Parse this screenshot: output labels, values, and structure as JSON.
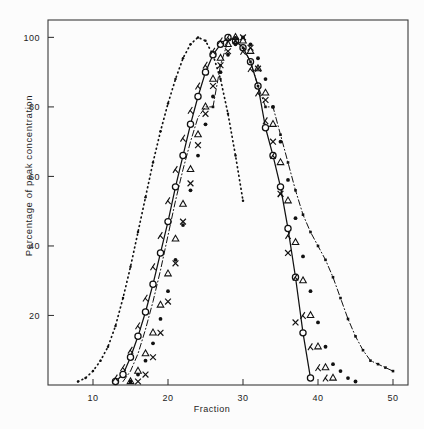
{
  "figure": {
    "background": "#fcfcfc",
    "axis_color": "#3a3a3a",
    "ink_color": "#111111"
  },
  "axes": {
    "xlabel": "Fraction",
    "ylabel": "Percentage of  peak  concentration",
    "x_ticks": [
      "10",
      "20",
      "30",
      "40",
      "50"
    ],
    "y_ticks": [
      "20",
      "40",
      "60",
      "80",
      "100"
    ]
  },
  "chart_data": {
    "type": "line",
    "title": "",
    "xlabel": "Fraction",
    "ylabel": "Percentage of peak concentration",
    "xlim": [
      4,
      52
    ],
    "ylim": [
      0,
      105
    ],
    "x_ticks": [
      10,
      20,
      30,
      40,
      50
    ],
    "y_ticks": [
      20,
      40,
      60,
      80,
      100
    ],
    "grid": false,
    "legend": "none",
    "frame": "box",
    "series": [
      {
        "name": "dotted-leading",
        "marker": "small-dot",
        "line": "dotted",
        "x": [
          8,
          9,
          10,
          11,
          12,
          13,
          14,
          15,
          16,
          17,
          18,
          19,
          20,
          21,
          22,
          23,
          24,
          25,
          26,
          27,
          28,
          29,
          30
        ],
        "y": [
          1,
          2,
          4,
          7,
          11,
          17,
          25,
          34,
          44,
          54,
          64,
          73,
          81,
          88,
          94,
          98,
          100,
          99,
          95,
          88,
          78,
          66,
          53
        ]
      },
      {
        "name": "open-circle-solid",
        "marker": "open-circle",
        "line": "solid",
        "x": [
          13,
          14,
          15,
          16,
          17,
          18,
          19,
          20,
          21,
          22,
          23,
          24,
          25,
          26,
          27,
          28,
          29,
          30,
          31,
          32,
          33,
          34,
          35,
          36,
          37,
          38,
          39
        ],
        "y": [
          1,
          3,
          8,
          14,
          21,
          29,
          38,
          47,
          57,
          66,
          75,
          83,
          90,
          95,
          98,
          100,
          99,
          97,
          93,
          86,
          74,
          66,
          57,
          45,
          31,
          15,
          2
        ]
      },
      {
        "name": "lambda-marker",
        "marker": "lambda",
        "line": "none",
        "x": [
          13,
          14,
          15,
          16,
          17,
          18,
          19,
          20,
          21,
          22,
          23,
          24,
          25,
          26,
          27,
          28,
          29,
          30,
          31,
          32,
          33,
          34,
          35,
          36,
          37,
          38,
          39,
          40,
          41
        ],
        "y": [
          2,
          5,
          10,
          17,
          25,
          34,
          43,
          53,
          62,
          71,
          79,
          86,
          92,
          96,
          99,
          100,
          99,
          96,
          91,
          84,
          76,
          66,
          55,
          43,
          31,
          20,
          11,
          5,
          2
        ]
      },
      {
        "name": "filled-dot",
        "marker": "filled-dot",
        "line": "none",
        "x": [
          15,
          16,
          17,
          18,
          19,
          20,
          21,
          22,
          23,
          24,
          25,
          26,
          27,
          28,
          29,
          30,
          31,
          32,
          33,
          34,
          35,
          36,
          37,
          38,
          39,
          40,
          41,
          42,
          43,
          44,
          45
        ],
        "y": [
          1,
          3,
          7,
          12,
          19,
          27,
          36,
          46,
          56,
          66,
          75,
          83,
          90,
          95,
          98,
          100,
          98,
          94,
          88,
          80,
          70,
          59,
          48,
          37,
          27,
          18,
          11,
          6,
          4,
          2,
          1
        ]
      },
      {
        "name": "open-triangle",
        "marker": "open-triangle",
        "line": "none",
        "x": [
          15,
          16,
          17,
          18,
          19,
          20,
          21,
          22,
          23,
          24,
          25,
          26,
          27,
          28,
          29,
          30,
          31,
          32,
          33,
          34,
          35,
          36,
          37,
          38,
          39,
          40,
          41,
          42
        ],
        "y": [
          1,
          4,
          9,
          15,
          23,
          32,
          42,
          52,
          62,
          72,
          80,
          88,
          94,
          98,
          100,
          99,
          96,
          91,
          84,
          75,
          64,
          53,
          41,
          30,
          20,
          11,
          5,
          2
        ]
      },
      {
        "name": "x-marker",
        "marker": "x",
        "line": "none",
        "x": [
          16,
          17,
          18,
          19,
          20,
          21,
          22,
          23,
          24,
          25,
          26,
          27,
          28,
          29,
          30,
          31,
          32,
          33,
          34,
          35,
          36,
          37
        ],
        "y": [
          1,
          3,
          8,
          15,
          24,
          35,
          47,
          58,
          69,
          78,
          86,
          92,
          96,
          99,
          100,
          97,
          91,
          82,
          70,
          55,
          38,
          18
        ]
      },
      {
        "name": "dash-dot-leading-edge",
        "marker": "none",
        "line": "dash-dot",
        "x": [
          14,
          15,
          16,
          17,
          18,
          19,
          20,
          21,
          22,
          23,
          24,
          25,
          26
        ],
        "y": [
          1,
          4,
          9,
          16,
          24,
          33,
          43,
          53,
          62,
          70,
          77,
          80,
          80
        ]
      },
      {
        "name": "dash-dot-trailing",
        "marker": "square-dot",
        "line": "dash-dot",
        "x": [
          26,
          27,
          28,
          29,
          30,
          31,
          32,
          33,
          34,
          35,
          36,
          37,
          38,
          39,
          40,
          41,
          42,
          43,
          44,
          45,
          46,
          47,
          48,
          49,
          50
        ],
        "y": [
          80,
          92,
          99,
          100,
          97,
          93,
          86,
          80,
          80,
          72,
          64,
          56,
          49,
          44,
          40,
          36,
          31,
          25,
          19,
          14,
          10,
          7,
          6,
          5,
          4
        ]
      }
    ]
  }
}
